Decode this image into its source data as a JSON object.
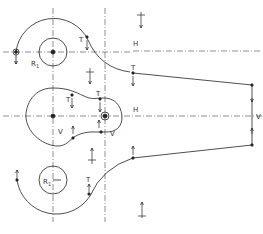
{
  "figure": {
    "labels": {
      "radius_top": "R",
      "radius_top_sub": "1",
      "radius_bottom": "R",
      "radius_bottom_sub": "1",
      "tangent_top_arc": "T",
      "tangent_top_line": "T",
      "tangent_mid_left": "T",
      "tangent_mid_right": "T",
      "tangent_bottom": "T",
      "horizontal_top": "H",
      "horizontal_mid": "H",
      "vertical_mid_left": "V",
      "vertical_mid_right": "V",
      "vertical_right_edge": "V"
    },
    "caption": ""
  },
  "colors": {
    "stroke": "#222222",
    "centerline": "#444444",
    "background": "#ffffff"
  }
}
